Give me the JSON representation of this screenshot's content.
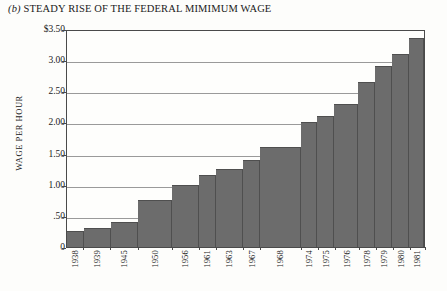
{
  "figure": {
    "label": "(b)",
    "title": "STEADY RISE OF THE FEDERAL MIMIMUM WAGE"
  },
  "chart_data": {
    "type": "bar",
    "title": "(b) STEADY RISE OF THE FEDERAL MIMIMUM WAGE",
    "xlabel": "",
    "ylabel": "WAGE PER HOUR",
    "categories": [
      "1938",
      "1939",
      "1945",
      "1950",
      "1956",
      "1961",
      "1963",
      "1967",
      "1968",
      "1974",
      "1975",
      "1976",
      "1978",
      "1979",
      "1980",
      "1981"
    ],
    "values": [
      0.25,
      0.3,
      0.4,
      0.75,
      1.0,
      1.15,
      1.25,
      1.4,
      1.6,
      2.0,
      2.1,
      2.3,
      2.65,
      2.9,
      3.1,
      3.35
    ],
    "widths": [
      1,
      1.6,
      1.6,
      2.0,
      1.6,
      1.0,
      1.6,
      1.0,
      2.4,
      1.0,
      1.0,
      1.4,
      1.0,
      1.0,
      1.0,
      0.9
    ],
    "ylim": [
      0,
      3.5
    ],
    "ytick_values": [
      3.5,
      3.0,
      2.5,
      2.0,
      1.5,
      1.0,
      0.5,
      0
    ],
    "ytick_labels": [
      "$3.50",
      "3.00",
      "2.50",
      "2.00",
      "1.50",
      "1.00",
      ".50",
      "0"
    ],
    "grid": true,
    "legend": "none",
    "bar_color": "#6c6c6c",
    "axis_color": "#4a4a4a",
    "grid_color": "#9a9a9a",
    "background": "#fdfdfb"
  }
}
